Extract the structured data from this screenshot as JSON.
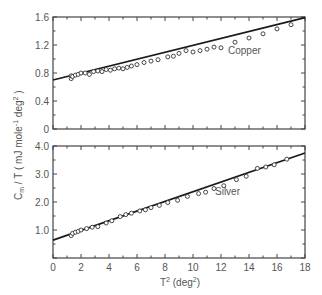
{
  "chart_data": [
    {
      "type": "scatter",
      "title": "",
      "panel": "top",
      "series_label": "Copper",
      "xlabel": "T² (deg²)",
      "ylabel": "C_m / T (mJ mole⁻¹ deg²)",
      "xlim": [
        0,
        18
      ],
      "ylim": [
        0,
        1.6
      ],
      "yticks": [
        "0",
        "0.4",
        "0.8",
        "1.2",
        "1.6"
      ],
      "xticks": [],
      "grid": false,
      "fit_line": {
        "x": [
          0,
          18
        ],
        "y": [
          0.7,
          1.59
        ]
      },
      "series": [
        {
          "name": "Copper",
          "x": [
            1.3,
            1.3,
            1.4,
            1.6,
            1.8,
            2.0,
            2.3,
            2.6,
            2.9,
            3.2,
            3.5,
            3.8,
            4.1,
            4.4,
            4.7,
            5.0,
            5.3,
            5.6,
            6.0,
            6.5,
            7.0,
            7.5,
            8.2,
            8.6,
            9.0,
            9.5,
            10.0,
            10.5,
            11.0,
            11.5,
            12.0,
            13.0,
            14.0,
            15.0,
            16.0,
            17.0
          ],
          "y": [
            0.72,
            0.76,
            0.75,
            0.77,
            0.78,
            0.8,
            0.8,
            0.78,
            0.82,
            0.83,
            0.82,
            0.85,
            0.84,
            0.86,
            0.87,
            0.86,
            0.88,
            0.9,
            0.92,
            0.95,
            0.97,
            0.99,
            1.03,
            1.04,
            1.08,
            1.12,
            1.1,
            1.12,
            1.14,
            1.17,
            1.16,
            1.24,
            1.3,
            1.36,
            1.43,
            1.49
          ]
        }
      ]
    },
    {
      "type": "scatter",
      "title": "",
      "panel": "bottom",
      "series_label": "Silver",
      "xlabel": "T² (deg²)",
      "ylabel": "C_m / T (mJ mole⁻¹ deg²)",
      "xlim": [
        0,
        18
      ],
      "ylim": [
        0,
        4.0
      ],
      "yticks": [
        "1.0",
        "2.0",
        "3.0",
        "4.0"
      ],
      "xticks": [
        "0",
        "2",
        "4",
        "6",
        "8",
        "10",
        "12",
        "14",
        "16",
        "18"
      ],
      "grid": false,
      "fit_line": {
        "x": [
          0,
          18
        ],
        "y": [
          0.64,
          3.75
        ]
      },
      "series": [
        {
          "name": "Silver",
          "x": [
            1.3,
            1.4,
            1.6,
            1.8,
            2.0,
            2.4,
            2.8,
            3.2,
            3.8,
            4.2,
            4.8,
            5.2,
            5.6,
            6.2,
            6.6,
            7.0,
            7.6,
            8.2,
            8.9,
            9.6,
            10.4,
            10.9,
            11.5,
            12.2,
            13.1,
            13.8,
            14.6,
            15.2,
            15.8,
            16.7
          ],
          "y": [
            0.8,
            0.88,
            0.92,
            0.95,
            1.0,
            1.05,
            1.1,
            1.12,
            1.25,
            1.33,
            1.48,
            1.55,
            1.6,
            1.68,
            1.72,
            1.8,
            1.88,
            1.98,
            2.06,
            2.2,
            2.3,
            2.35,
            2.48,
            2.58,
            2.8,
            2.92,
            3.2,
            3.25,
            3.33,
            3.53
          ]
        }
      ]
    }
  ],
  "labels": {
    "copper": "Copper",
    "silver": "Silver",
    "ylabel": "C",
    "ylabel_sub": "m",
    "ylabel_rest": " / T ( mJ  mole",
    "ylabel_sup1": "-1",
    "ylabel_rest2": "  deg",
    "ylabel_sup2": "2",
    "ylabel_close": " )",
    "xlabel": "T",
    "xlabel_sup": "2",
    "xlabel_rest": " (deg",
    "xlabel_sup2": "2",
    "xlabel_close": ")"
  },
  "ticks": {
    "top_y": [
      "0",
      "0.4",
      "0.8",
      "1.2",
      "1.6"
    ],
    "bottom_y": [
      "1.0",
      "2.0",
      "3.0",
      "4.0"
    ],
    "x": [
      "0",
      "2",
      "4",
      "6",
      "8",
      "10",
      "12",
      "14",
      "16",
      "18"
    ]
  }
}
